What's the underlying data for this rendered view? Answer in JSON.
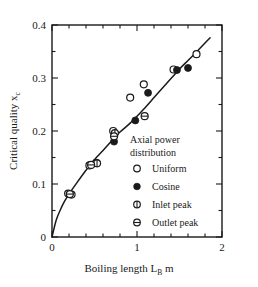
{
  "chart_data": {
    "type": "scatter",
    "title": "",
    "xlabel": "Boiling length L_B   m",
    "ylabel": "Critical quality x_c",
    "xlim": [
      0,
      2
    ],
    "ylim": [
      0,
      0.4
    ],
    "xticks": [
      0,
      1,
      2
    ],
    "xticklabels": [
      "0",
      "1",
      "2"
    ],
    "xminor_step": 0.2,
    "yticks": [
      0,
      0.1,
      0.2,
      0.3,
      0.4
    ],
    "yticklabels": [
      "0",
      "0.1",
      "0.2",
      "0.3",
      "0.4"
    ],
    "yminor_step": 0.05,
    "grid": false,
    "legend_position": "inside-lower-right",
    "series": [
      {
        "name": "Uniform",
        "marker": "open-circle",
        "points": [
          {
            "x": 0.19,
            "y": 0.082
          },
          {
            "x": 0.44,
            "y": 0.135
          },
          {
            "x": 0.52,
            "y": 0.14
          },
          {
            "x": 0.72,
            "y": 0.2
          },
          {
            "x": 0.92,
            "y": 0.263
          },
          {
            "x": 1.08,
            "y": 0.288
          },
          {
            "x": 1.43,
            "y": 0.316
          },
          {
            "x": 1.7,
            "y": 0.345
          }
        ]
      },
      {
        "name": "Cosine",
        "marker": "filled-circle",
        "points": [
          {
            "x": 0.73,
            "y": 0.18
          },
          {
            "x": 0.98,
            "y": 0.22
          },
          {
            "x": 1.13,
            "y": 0.272
          },
          {
            "x": 1.47,
            "y": 0.315
          },
          {
            "x": 1.6,
            "y": 0.319
          }
        ]
      },
      {
        "name": "Inlet peak",
        "marker": "circle-vertical-bar",
        "points": [
          {
            "x": 0.23,
            "y": 0.08
          },
          {
            "x": 0.53,
            "y": 0.139
          },
          {
            "x": 0.74,
            "y": 0.196
          }
        ]
      },
      {
        "name": "Outlet peak",
        "marker": "circle-horizontal-bar",
        "points": [
          {
            "x": 0.21,
            "y": 0.081
          },
          {
            "x": 0.46,
            "y": 0.136
          },
          {
            "x": 0.73,
            "y": 0.19
          },
          {
            "x": 1.09,
            "y": 0.228
          }
        ]
      }
    ],
    "fit_curve": {
      "name": "correlation-curve",
      "points": [
        {
          "x": 0.0,
          "y": 0.0
        },
        {
          "x": 0.05,
          "y": 0.032
        },
        {
          "x": 0.1,
          "y": 0.052
        },
        {
          "x": 0.15,
          "y": 0.068
        },
        {
          "x": 0.2,
          "y": 0.081
        },
        {
          "x": 0.3,
          "y": 0.104
        },
        {
          "x": 0.4,
          "y": 0.126
        },
        {
          "x": 0.5,
          "y": 0.146
        },
        {
          "x": 0.6,
          "y": 0.163
        },
        {
          "x": 0.7,
          "y": 0.181
        },
        {
          "x": 0.8,
          "y": 0.198
        },
        {
          "x": 0.9,
          "y": 0.212
        },
        {
          "x": 1.0,
          "y": 0.228
        },
        {
          "x": 1.1,
          "y": 0.245
        },
        {
          "x": 1.2,
          "y": 0.263
        },
        {
          "x": 1.3,
          "y": 0.281
        },
        {
          "x": 1.4,
          "y": 0.299
        },
        {
          "x": 1.5,
          "y": 0.317
        },
        {
          "x": 1.6,
          "y": 0.333
        },
        {
          "x": 1.7,
          "y": 0.349
        },
        {
          "x": 1.8,
          "y": 0.366
        },
        {
          "x": 1.86,
          "y": 0.376
        }
      ]
    }
  },
  "axes": {
    "xlabel_main": "Boiling length L",
    "xlabel_sub": "B",
    "xlabel_unit": "m",
    "ylabel_main": "Critical quality x",
    "ylabel_sub": "c",
    "xticklabels": [
      "0",
      "1",
      "2"
    ],
    "yticklabels": [
      "0",
      "0.1",
      "0.2",
      "0.3",
      "0.4"
    ]
  },
  "legend": {
    "title_line1": "Axial power",
    "title_line2": "distribution",
    "entries": [
      {
        "label": "Uniform",
        "marker": "open-circle"
      },
      {
        "label": "Cosine",
        "marker": "filled-circle"
      },
      {
        "label": "Inlet peak",
        "marker": "circle-vertical-bar"
      },
      {
        "label": "Outlet peak",
        "marker": "circle-horizontal-bar"
      }
    ]
  },
  "colors": {
    "ink": "#1a1a1a",
    "background": "#ffffff"
  }
}
